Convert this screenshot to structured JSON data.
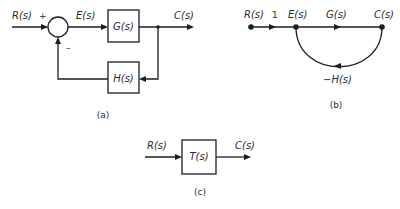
{
  "diagram": {
    "panel_a": {
      "caption": "(a)",
      "input_label": "R(s)",
      "plus_sign": "+",
      "minus_sign": "–",
      "error_label": "E(s)",
      "forward_block": "G(s)",
      "output_label": "C(s)",
      "feedback_block": "H(s)"
    },
    "panel_b": {
      "caption": "(b)",
      "node_input": "R(s)",
      "branch_unity": "1",
      "node_error": "E(s)",
      "branch_forward": "G(s)",
      "node_output": "C(s)",
      "branch_feedback": "−H(s)"
    },
    "panel_c": {
      "caption": "(c)",
      "input_label": "R(s)",
      "block": "T(s)",
      "output_label": "C(s)"
    }
  }
}
